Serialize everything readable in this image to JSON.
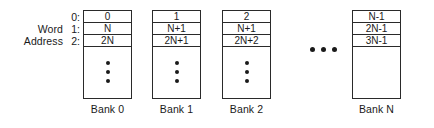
{
  "diagram": {
    "axis_label": {
      "line1": "Word",
      "line2": "Address"
    },
    "row_indices": [
      "0:",
      "1:",
      "2:"
    ],
    "banks": [
      {
        "caption": "Bank 0",
        "cells": [
          "0",
          "N",
          "2N"
        ],
        "has_vertical_ellipsis": true
      },
      {
        "caption": "Bank 1",
        "cells": [
          "1",
          "N+1",
          "2N+1"
        ],
        "has_vertical_ellipsis": true
      },
      {
        "caption": "Bank 2",
        "cells": [
          "2",
          "N+1",
          "2N+2"
        ],
        "has_vertical_ellipsis": true
      },
      {
        "caption": "Bank N",
        "cells": [
          "N-1",
          "2N-1",
          "3N-1"
        ],
        "has_vertical_ellipsis": false
      }
    ],
    "ellipsis_between_banks": "•••",
    "colors": {
      "background": "#ffffff",
      "stroke": "#2a2a2a",
      "text": "#1a1a1a"
    }
  }
}
